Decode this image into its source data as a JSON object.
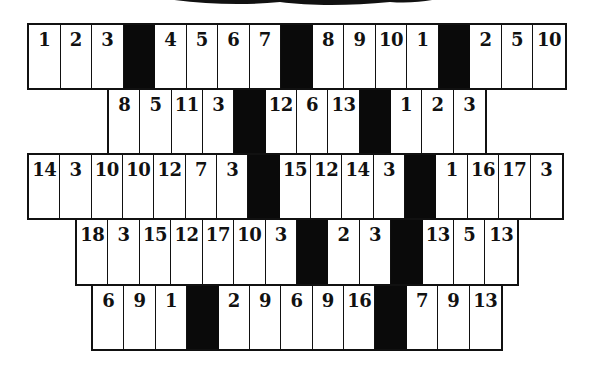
{
  "puzzle": {
    "type": "cryptogram-number-grid",
    "rows": [
      {
        "cells": [
          "1",
          "2",
          "3",
          "",
          "4",
          "5",
          "6",
          "7",
          "",
          "8",
          "9",
          "10",
          "1",
          "",
          "2",
          "5",
          "10"
        ],
        "blocks": [
          false,
          false,
          false,
          true,
          false,
          false,
          false,
          false,
          true,
          false,
          false,
          false,
          false,
          true,
          false,
          false,
          false
        ]
      },
      {
        "cells": [
          "8",
          "5",
          "11",
          "3",
          "",
          "12",
          "6",
          "13",
          "",
          "1",
          "2",
          "3"
        ],
        "blocks": [
          false,
          false,
          false,
          false,
          true,
          false,
          false,
          false,
          true,
          false,
          false,
          false
        ]
      },
      {
        "cells": [
          "14",
          "3",
          "10",
          "10",
          "12",
          "7",
          "3",
          "",
          "15",
          "12",
          "14",
          "3",
          "",
          "1",
          "16",
          "17",
          "3"
        ],
        "blocks": [
          false,
          false,
          false,
          false,
          false,
          false,
          false,
          true,
          false,
          false,
          false,
          false,
          true,
          false,
          false,
          false,
          false
        ]
      },
      {
        "cells": [
          "18",
          "3",
          "15",
          "12",
          "17",
          "10",
          "3",
          "",
          "2",
          "3",
          "",
          "13",
          "5",
          "13"
        ],
        "blocks": [
          false,
          false,
          false,
          false,
          false,
          false,
          false,
          true,
          false,
          false,
          true,
          false,
          false,
          false
        ]
      },
      {
        "cells": [
          "6",
          "9",
          "1",
          "",
          "2",
          "9",
          "6",
          "9",
          "16",
          "",
          "7",
          "9",
          "13"
        ],
        "blocks": [
          false,
          false,
          false,
          true,
          false,
          false,
          false,
          false,
          false,
          true,
          false,
          false,
          false
        ]
      }
    ]
  },
  "colors": {
    "ink": "#111111",
    "paper": "#ffffff"
  }
}
